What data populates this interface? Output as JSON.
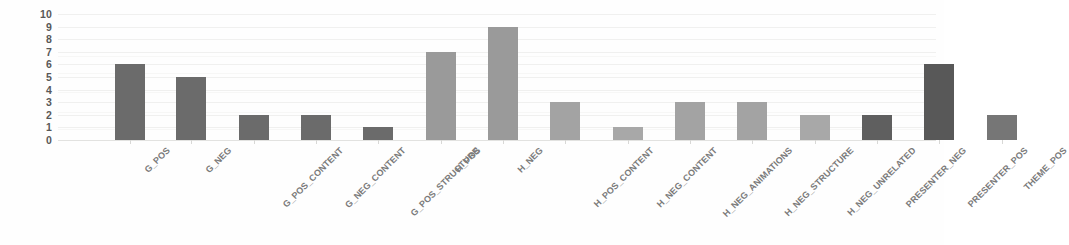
{
  "chart_data": {
    "type": "bar",
    "title": "",
    "subtitle": "",
    "xlabel": "",
    "ylabel": "",
    "ylim": [
      0,
      10
    ],
    "ytick_labels": [
      "10",
      "9",
      "8",
      "7",
      "6",
      "5",
      "4",
      "3",
      "2",
      "1",
      "0"
    ],
    "yticks": [
      10,
      9,
      8,
      7,
      6,
      5,
      4,
      3,
      2,
      1,
      0
    ],
    "grid": true,
    "legend": "none",
    "categories": [
      "G_POS",
      "G_NEG",
      "G_POS_CONTENT",
      "G_NEG_CONTENT",
      "G_POS_STRUCTURE",
      "H_POS",
      "H_NEG",
      "H_POS_CONTENT",
      "H_NEG_CONTENT",
      "H_NEG_ANIMATIONS",
      "H_NEG_STRUCTURE",
      "H_NEG_UNRELATED",
      "PRESENTER_NEG",
      "PRESENTER_POS",
      "THEME_POS"
    ],
    "values": [
      6,
      5,
      2,
      2,
      1,
      7,
      9,
      3,
      1,
      3,
      3,
      2,
      2,
      6,
      2
    ],
    "bar_colors": [
      "#6b6b6b",
      "#6b6b6b",
      "#6b6b6b",
      "#6b6b6b",
      "#6b6b6b",
      "#9a9a9a",
      "#9a9a9a",
      "#a3a3a3",
      "#a8a8a8",
      "#a3a3a3",
      "#a3a3a3",
      "#a8a8a8",
      "#5f5f5f",
      "#585858",
      "#767676"
    ],
    "bar_positions": [
      72,
      133,
      196,
      258,
      320,
      383,
      445,
      507,
      570,
      632,
      694,
      757,
      819,
      881,
      944
    ],
    "axis_gap_after_index": 4,
    "background_color": "#fefefe",
    "gridline_color": "#f0f0ef",
    "tick_label_color": "#585858",
    "category_label_color": "#7a7a7a"
  }
}
